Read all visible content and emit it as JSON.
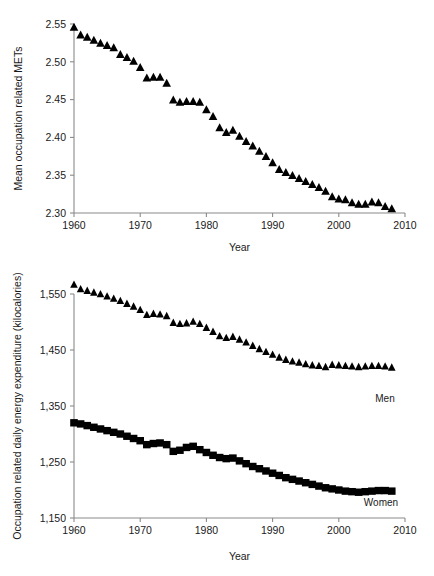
{
  "page": {
    "cut_header_text": "",
    "background_color": "#ffffff",
    "marker_color": "#000000",
    "axis_color": "#8a8a8a"
  },
  "charts": {
    "top": {
      "axis_title_y": "Mean occupation related METs",
      "axis_title_x": "Year",
      "y_ticks": [
        "2.30",
        "2.35",
        "2.40",
        "2.45",
        "2.50",
        "2.55"
      ],
      "x_ticks": [
        "1960",
        "1970",
        "1980",
        "1990",
        "2000",
        "2010"
      ]
    },
    "bottom": {
      "axis_title_y": "Occupation related daily energy expenditure (kilocalories)",
      "axis_title_x": "Year",
      "y_ticks": [
        "1,150",
        "1,250",
        "1,350",
        "1,450",
        "1,550"
      ],
      "x_ticks": [
        "1960",
        "1970",
        "1980",
        "1990",
        "2000",
        "2010"
      ],
      "label_men": "Men",
      "label_women": "Women"
    }
  },
  "chart_data": [
    {
      "id": "mean-occupation-related-mets",
      "type": "scatter",
      "title": "",
      "xlabel": "Year",
      "ylabel": "Mean occupation related METs",
      "xlim": [
        1960,
        2010
      ],
      "ylim": [
        2.3,
        2.55
      ],
      "yticks": [
        2.3,
        2.35,
        2.4,
        2.45,
        2.5,
        2.55
      ],
      "xticks": [
        1960,
        1970,
        1980,
        1990,
        2000,
        2010
      ],
      "grid": false,
      "legend": "none",
      "marker": "triangle",
      "x": [
        1960,
        1961,
        1962,
        1963,
        1964,
        1965,
        1966,
        1967,
        1968,
        1969,
        1970,
        1971,
        1972,
        1973,
        1974,
        1975,
        1976,
        1977,
        1978,
        1979,
        1980,
        1981,
        1982,
        1983,
        1984,
        1985,
        1986,
        1987,
        1988,
        1989,
        1990,
        1991,
        1992,
        1993,
        1994,
        1995,
        1996,
        1997,
        1998,
        1999,
        2000,
        2001,
        2002,
        2003,
        2004,
        2005,
        2006,
        2007,
        2008
      ],
      "values": [
        2.545,
        2.535,
        2.532,
        2.528,
        2.524,
        2.521,
        2.518,
        2.509,
        2.505,
        2.5,
        2.492,
        2.478,
        2.479,
        2.479,
        2.471,
        2.449,
        2.446,
        2.447,
        2.447,
        2.446,
        2.436,
        2.427,
        2.412,
        2.406,
        2.409,
        2.401,
        2.394,
        2.388,
        2.381,
        2.374,
        2.366,
        2.357,
        2.353,
        2.349,
        2.345,
        2.341,
        2.337,
        2.333,
        2.328,
        2.321,
        2.318,
        2.317,
        2.313,
        2.311,
        2.311,
        2.314,
        2.313,
        2.308,
        2.305
      ]
    },
    {
      "id": "occupation-related-daily-energy-expenditure",
      "type": "scatter",
      "title": "",
      "xlabel": "Year",
      "ylabel": "Occupation related daily energy expenditure (kilocalories)",
      "xlim": [
        1960,
        2010
      ],
      "ylim": [
        1150,
        1550
      ],
      "yticks": [
        1150,
        1250,
        1350,
        1450,
        1550
      ],
      "xticks": [
        1960,
        1970,
        1980,
        1990,
        2000,
        2010
      ],
      "grid": false,
      "legend": "inline-right",
      "series": [
        {
          "name": "Men",
          "marker": "triangle",
          "x": [
            1960,
            1961,
            1962,
            1963,
            1964,
            1965,
            1966,
            1967,
            1968,
            1969,
            1970,
            1971,
            1972,
            1973,
            1974,
            1975,
            1976,
            1977,
            1978,
            1979,
            1980,
            1981,
            1982,
            1983,
            1984,
            1985,
            1986,
            1987,
            1988,
            1989,
            1990,
            1991,
            1992,
            1993,
            1994,
            1995,
            1996,
            1997,
            1998,
            1999,
            2000,
            2001,
            2002,
            2003,
            2004,
            2005,
            2006,
            2007,
            2008
          ],
          "values": [
            1566,
            1558,
            1555,
            1552,
            1549,
            1545,
            1541,
            1537,
            1532,
            1527,
            1521,
            1512,
            1514,
            1513,
            1510,
            1498,
            1496,
            1497,
            1500,
            1496,
            1489,
            1482,
            1474,
            1471,
            1473,
            1468,
            1463,
            1457,
            1451,
            1446,
            1441,
            1436,
            1432,
            1429,
            1427,
            1424,
            1422,
            1421,
            1419,
            1423,
            1422,
            1421,
            1420,
            1419,
            1420,
            1421,
            1421,
            1420,
            1418
          ]
        },
        {
          "name": "Women",
          "marker": "square",
          "x": [
            1960,
            1961,
            1962,
            1963,
            1964,
            1965,
            1966,
            1967,
            1968,
            1969,
            1970,
            1971,
            1972,
            1973,
            1974,
            1975,
            1976,
            1977,
            1978,
            1979,
            1980,
            1981,
            1982,
            1983,
            1984,
            1985,
            1986,
            1987,
            1988,
            1989,
            1990,
            1991,
            1992,
            1993,
            1994,
            1995,
            1996,
            1997,
            1998,
            1999,
            2000,
            2001,
            2002,
            2003,
            2004,
            2005,
            2006,
            2007,
            2008
          ],
          "values": [
            1320,
            1318,
            1315,
            1312,
            1309,
            1306,
            1303,
            1300,
            1296,
            1292,
            1288,
            1281,
            1283,
            1284,
            1281,
            1269,
            1271,
            1276,
            1278,
            1272,
            1267,
            1262,
            1258,
            1256,
            1257,
            1252,
            1247,
            1242,
            1238,
            1234,
            1230,
            1226,
            1222,
            1219,
            1216,
            1213,
            1210,
            1207,
            1204,
            1202,
            1200,
            1198,
            1197,
            1196,
            1197,
            1198,
            1199,
            1199,
            1198
          ]
        }
      ]
    }
  ]
}
